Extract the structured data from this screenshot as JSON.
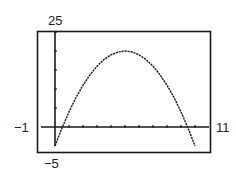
{
  "chart_data": {
    "type": "line",
    "title": "",
    "xlabel": "",
    "ylabel": "",
    "function": "y = -x^2 + 10x - 5",
    "xlim": [
      -1,
      11
    ],
    "ylim": [
      -5,
      25
    ],
    "xscale": 1,
    "yscale": 5,
    "grid": false,
    "legend": null,
    "window_labels": {
      "xmin": "−1",
      "xmax": "11",
      "ymin": "−5",
      "ymax": "25"
    },
    "series": [
      {
        "name": "curve",
        "x": [
          0,
          0.5,
          1,
          1.5,
          2,
          2.5,
          3,
          3.5,
          4,
          4.5,
          5,
          5.5,
          6,
          6.5,
          7,
          7.5,
          8,
          8.5,
          9,
          9.5,
          10
        ],
        "values": [
          -5,
          -0.25,
          4,
          7.75,
          11,
          13.75,
          16,
          17.75,
          19,
          19.75,
          20,
          19.75,
          19,
          17.75,
          16,
          13.75,
          11,
          7.75,
          4,
          -0.25,
          -5
        ]
      }
    ],
    "x_ticks": [
      0,
      1,
      2,
      3,
      4,
      5,
      6,
      7,
      8,
      9,
      10
    ],
    "y_ticks": [
      0,
      5,
      10,
      15,
      20,
      25
    ],
    "colors": {
      "line": "#1a1a1a",
      "frame": "#1a1a1a",
      "axes": "#1a1a1a"
    }
  }
}
